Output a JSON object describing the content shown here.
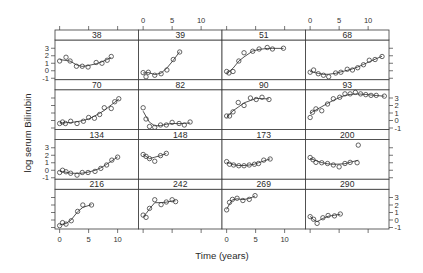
{
  "chart_data": {
    "type": "scatter",
    "subtype": "trellis scatter with smooth curve per panel",
    "title": "",
    "xlabel": "Time (years)",
    "ylabel": "log serum Bilirubin",
    "xlim": [
      -0.8,
      13.6
    ],
    "ylim": [
      -1.2,
      4.1
    ],
    "x_ticks": [
      0,
      5,
      10
    ],
    "y_ticks": [
      -1,
      0,
      1,
      2,
      3
    ],
    "grid": false,
    "legend": null,
    "layout": {
      "columns": 4,
      "rows": 4
    },
    "panels": [
      {
        "label": "38",
        "x": [
          0,
          1.1,
          1.8,
          2.9,
          3.9,
          4.9,
          6.3,
          7.3,
          8.2,
          8.9
        ],
        "y": [
          1.3,
          1.8,
          1.3,
          0.6,
          0.6,
          0.5,
          1.1,
          1.0,
          1.4,
          1.9
        ]
      },
      {
        "label": "39",
        "x": [
          0,
          0.5,
          0.9,
          2.0,
          3.1,
          4.1,
          5.2,
          6.3
        ],
        "y": [
          -0.25,
          -0.8,
          -0.2,
          -0.6,
          -0.4,
          0.1,
          1.5,
          2.5
        ]
      },
      {
        "label": "51",
        "x": [
          0,
          0.4,
          1.1,
          2.1,
          3.0,
          4.5,
          5.6,
          7.0,
          7.9,
          9.8
        ],
        "y": [
          -0.1,
          -0.3,
          -0.1,
          1.3,
          2.4,
          2.6,
          2.9,
          3.1,
          2.9,
          3.0
        ]
      },
      {
        "label": "68",
        "x": [
          0,
          0.6,
          1.4,
          2.3,
          3.2,
          4.4,
          5.3,
          6.4,
          7.3,
          8.2,
          9.2,
          10.2,
          11.2,
          12.4
        ],
        "y": [
          -0.2,
          0.1,
          -0.4,
          -0.6,
          -0.8,
          -0.3,
          -0.2,
          0.2,
          0.1,
          0.4,
          0.8,
          1.4,
          1.5,
          1.9
        ]
      },
      {
        "label": "70",
        "x": [
          0,
          0.5,
          1.0,
          1.9,
          3.0,
          4.1,
          5.0,
          6.0,
          6.9,
          7.7,
          8.9,
          9.5,
          10.2
        ],
        "y": [
          -0.4,
          -0.2,
          -0.4,
          -0.1,
          -0.4,
          -0.1,
          0.4,
          0.3,
          0.8,
          1.7,
          1.6,
          2.5,
          2.9
        ]
      },
      {
        "label": "82",
        "x": [
          0,
          0.5,
          1.1,
          2.0,
          3.0,
          4.0,
          5.0,
          6.2,
          7.1,
          8.1
        ],
        "y": [
          1.7,
          0.2,
          -0.8,
          -0.9,
          -0.6,
          -0.6,
          -0.25,
          -0.4,
          -0.6,
          -0.2
        ]
      },
      {
        "label": "90",
        "x": [
          0,
          0.5,
          1.1,
          2.0,
          3.0,
          4.1,
          5.1,
          6.1,
          7.3
        ],
        "y": [
          0.6,
          0.6,
          1.15,
          2.4,
          2.0,
          3.0,
          2.8,
          3.1,
          2.8
        ]
      },
      {
        "label": "93",
        "x": [
          0,
          0.4,
          1.0,
          2.0,
          3.0,
          4.0,
          5.1,
          6.0,
          6.9,
          7.8,
          8.7,
          9.6,
          10.5,
          11.4,
          12.8
        ],
        "y": [
          0.4,
          1.1,
          1.55,
          1.3,
          2.2,
          2.9,
          3.1,
          3.55,
          3.55,
          3.75,
          3.55,
          3.45,
          3.35,
          3.35,
          3.25
        ]
      },
      {
        "label": "134",
        "x": [
          0,
          0.5,
          1.1,
          1.9,
          3.0,
          3.9,
          4.9,
          6.1,
          7.1,
          8.1,
          9.0,
          10.0
        ],
        "y": [
          -0.3,
          0.0,
          -0.2,
          -0.4,
          -0.65,
          -0.3,
          -0.3,
          -0.15,
          0.25,
          0.7,
          1.35,
          1.75
        ]
      },
      {
        "label": "148",
        "x": [
          0,
          0.5,
          1.1,
          2.0,
          3.0,
          4.0
        ],
        "y": [
          2.1,
          1.85,
          1.55,
          1.2,
          1.95,
          2.25
        ]
      },
      {
        "label": "173",
        "x": [
          0,
          0.5,
          1.2,
          2.1,
          3.0,
          3.9,
          4.8,
          5.5,
          6.4,
          7.5
        ],
        "y": [
          1.15,
          0.8,
          0.7,
          0.6,
          0.6,
          0.7,
          0.8,
          0.9,
          1.35,
          1.5
        ]
      },
      {
        "label": "200",
        "x": [
          0,
          0.5,
          1.0,
          2.0,
          3.0,
          4.0,
          5.0,
          6.0,
          6.9,
          8.1,
          8.3
        ],
        "y": [
          1.7,
          1.4,
          1.05,
          1.0,
          0.9,
          0.7,
          0.45,
          0.9,
          1.05,
          1.0,
          3.35
        ]
      },
      {
        "label": "216",
        "x": [
          0,
          0.5,
          1.1,
          2.0,
          3.1,
          4.0,
          5.5
        ],
        "y": [
          -0.75,
          -0.35,
          -0.55,
          -0.1,
          1.15,
          2.0,
          2.0
        ]
      },
      {
        "label": "242",
        "x": [
          0,
          0.5,
          1.1,
          2.0,
          3.1,
          4.0,
          5.0,
          5.6
        ],
        "y": [
          0.65,
          0.35,
          1.55,
          2.7,
          2.05,
          2.4,
          2.7,
          2.45
        ]
      },
      {
        "label": "269",
        "x": [
          0,
          0.5,
          1.0,
          1.8,
          2.8,
          3.9,
          4.9
        ],
        "y": [
          1.35,
          2.35,
          2.75,
          2.9,
          2.6,
          2.75,
          3.25
        ]
      },
      {
        "label": "290",
        "x": [
          0,
          0.6,
          1.2,
          2.2,
          3.1,
          4.2,
          5.2
        ],
        "y": [
          0.45,
          0.1,
          -0.45,
          0.3,
          0.6,
          0.55,
          0.8
        ]
      }
    ]
  }
}
